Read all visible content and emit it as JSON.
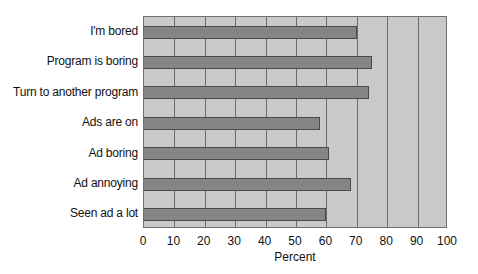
{
  "chart_data": {
    "type": "bar",
    "orientation": "horizontal",
    "title": "",
    "xlabel": "Percent",
    "ylabel": "",
    "xlim": [
      0,
      100
    ],
    "xticks": [
      0,
      10,
      20,
      30,
      40,
      50,
      60,
      70,
      80,
      90,
      100
    ],
    "grid": "vertical",
    "categories": [
      "I'm bored",
      "Program is boring",
      "Turn to another program",
      "Ads are on",
      "Ad boring",
      "Ad annoying",
      "Seen ad a lot"
    ],
    "values": [
      70,
      75,
      74,
      58,
      61,
      68,
      60
    ],
    "colors": {
      "bar": "#858585",
      "plot_bg": "#c9c9c9",
      "grid": "#6a6a6a"
    }
  },
  "labels": {
    "xlabel": "Percent",
    "ticks": [
      "0",
      "10",
      "20",
      "30",
      "40",
      "50",
      "60",
      "70",
      "80",
      "90",
      "100"
    ],
    "categories": [
      "I'm bored",
      "Program is boring",
      "Turn to another program",
      "Ads are on",
      "Ad boring",
      "Ad annoying",
      "Seen ad a lot"
    ]
  }
}
